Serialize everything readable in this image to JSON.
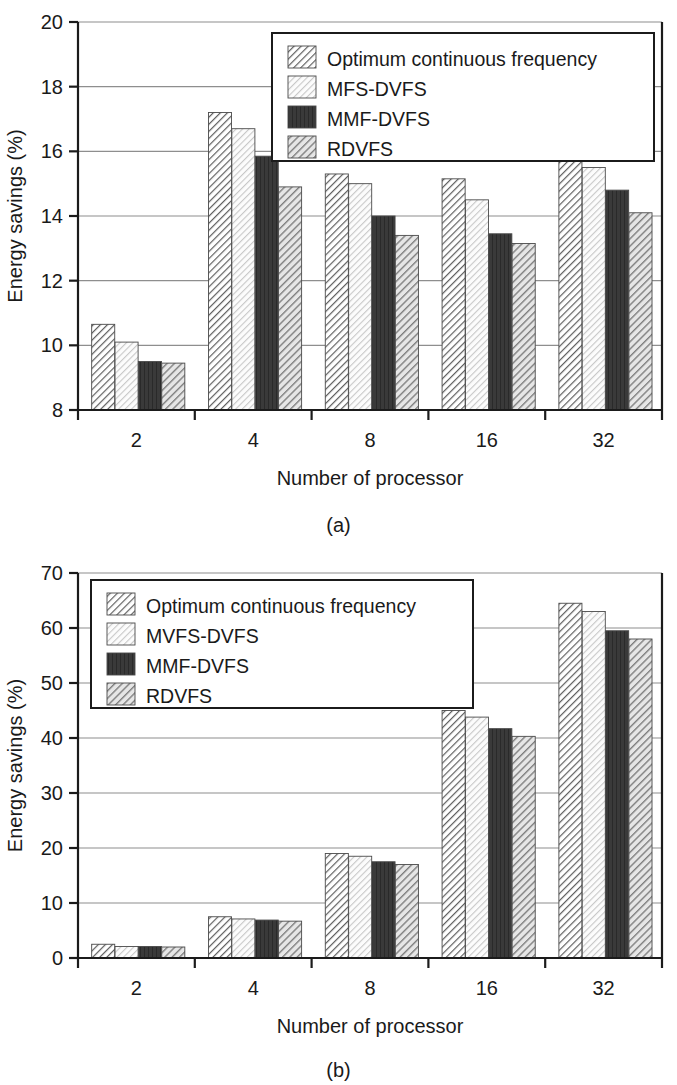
{
  "figure": {
    "panels": [
      {
        "caption": "(a)",
        "legend_position": "top-right",
        "legend_entries": [
          "Optimum continuous frequency",
          "MFS-DVFS",
          "MMF-DVFS",
          "RDVFS"
        ],
        "chart_data": {
          "type": "bar",
          "title": "",
          "xlabel": "Number of processor",
          "ylabel": "Energy savings (%)",
          "categories": [
            "2",
            "4",
            "8",
            "16",
            "32"
          ],
          "ylim": [
            8,
            20
          ],
          "yticks": [
            8,
            10,
            12,
            14,
            16,
            18,
            20
          ],
          "grid": true,
          "series": [
            {
              "name": "Optimum continuous frequency",
              "values": [
                10.65,
                17.2,
                15.3,
                15.15,
                15.95
              ]
            },
            {
              "name": "MFS-DVFS",
              "values": [
                10.1,
                16.7,
                15.0,
                14.5,
                15.5
              ]
            },
            {
              "name": "MMF-DVFS",
              "values": [
                9.5,
                15.85,
                14.0,
                13.45,
                14.8
              ]
            },
            {
              "name": "RDVFS",
              "values": [
                9.45,
                14.9,
                13.4,
                13.15,
                14.1
              ]
            }
          ]
        }
      },
      {
        "caption": "(b)",
        "legend_position": "top-left",
        "legend_entries": [
          "Optimum continuous frequency",
          "MVFS-DVFS",
          "MMF-DVFS",
          "RDVFS"
        ],
        "chart_data": {
          "type": "bar",
          "title": "",
          "xlabel": "Number of processor",
          "ylabel": "Energy savings (%)",
          "categories": [
            "2",
            "4",
            "8",
            "16",
            "32"
          ],
          "ylim": [
            0,
            70
          ],
          "yticks": [
            0,
            10,
            20,
            30,
            40,
            50,
            60,
            70
          ],
          "grid": true,
          "series": [
            {
              "name": "Optimum continuous frequency",
              "values": [
                2.5,
                7.5,
                19.0,
                45.0,
                64.5
              ]
            },
            {
              "name": "MVFS-DVFS",
              "values": [
                2.1,
                7.1,
                18.5,
                43.8,
                63.0
              ]
            },
            {
              "name": "MMF-DVFS",
              "values": [
                2.1,
                6.9,
                17.5,
                41.7,
                59.5
              ]
            },
            {
              "name": "RDVFS",
              "values": [
                2.0,
                6.7,
                17.0,
                40.3,
                58.0
              ]
            }
          ]
        }
      }
    ],
    "series_styles": [
      {
        "name": "Optimum continuous frequency",
        "fill": "#ffffff",
        "hatch": "diag-forward-dark",
        "ink": "#5a5a5a"
      },
      {
        "name": "MFS-DVFS",
        "fill": "#ffffff",
        "hatch": "diag-forward-light",
        "ink": "#cfcfcf"
      },
      {
        "name": "MMF-DVFS",
        "fill": "#3a3a3a",
        "hatch": "solid-dark",
        "ink": "#2e2e2e"
      },
      {
        "name": "RDVFS",
        "fill": "#ffffff",
        "hatch": "diag-forward-mid",
        "ink": "#7d7d7d"
      }
    ]
  }
}
